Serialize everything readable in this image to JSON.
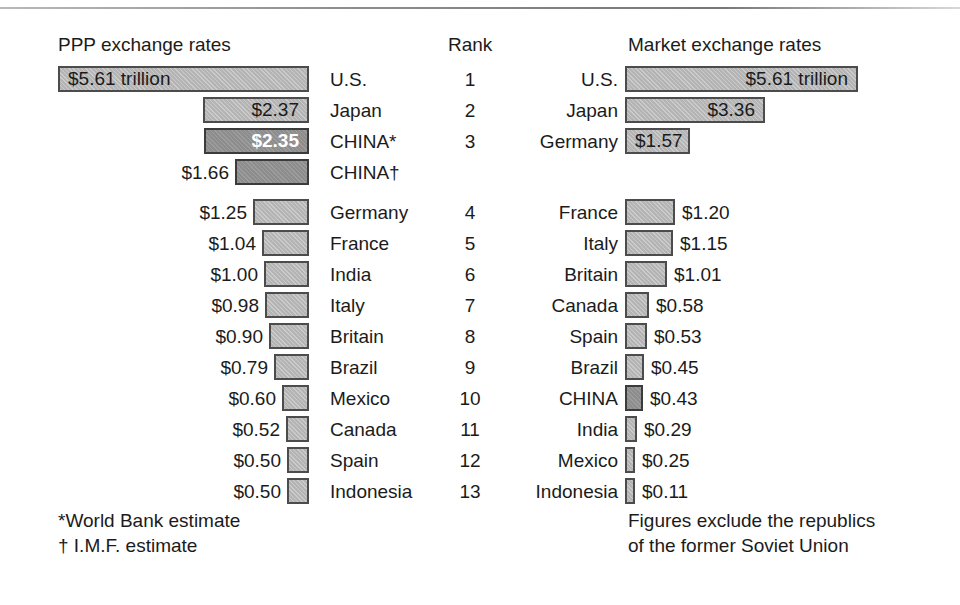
{
  "headers": {
    "ppp": "PPP exchange rates",
    "rank": "Rank",
    "market": "Market exchange rates"
  },
  "footnotes": {
    "left_line1": "*World Bank estimate",
    "left_line2": "† I.M.F. estimate",
    "right_line1": "Figures exclude the republics",
    "right_line2": "of the former Soviet Union"
  },
  "colors": {
    "bar_light": "#b4b4b4",
    "bar_dark": "#8d8d8d",
    "bar_border": "#4c4c4c",
    "text": "#1b1b1b",
    "label_on_dark": "#ffffff",
    "background": "#ffffff",
    "rule": "#8e8e8e"
  },
  "chart_data": {
    "type": "bar",
    "unit": "trillions of U.S. dollars",
    "xlabel": "",
    "ylabel": "",
    "grid": false,
    "legend": "none",
    "orientation": "horizontal",
    "panels": [
      {
        "name": "ppp",
        "title": "PPP exchange rates",
        "direction": "right-to-left",
        "max_value": 5.61,
        "categories": [
          "U.S.",
          "Japan",
          "CHINA*",
          "CHINA†",
          "Germany",
          "France",
          "India",
          "Italy",
          "Britain",
          "Brazil",
          "Mexico",
          "Canada",
          "Spain",
          "Indonesia"
        ],
        "values": [
          5.61,
          2.37,
          2.35,
          1.66,
          1.25,
          1.04,
          1.0,
          0.98,
          0.9,
          0.79,
          0.6,
          0.52,
          0.5,
          0.5
        ],
        "labels": [
          "$5.61 trillion",
          "$2.37",
          "$2.35",
          "$1.66",
          "$1.25",
          "$1.04",
          "$1.00",
          "$0.98",
          "$0.90",
          "$0.79",
          "$0.60",
          "$0.52",
          "$0.50",
          "$0.50"
        ]
      },
      {
        "name": "market",
        "title": "Market exchange rates",
        "direction": "left-to-right",
        "max_value": 5.61,
        "categories": [
          "U.S.",
          "Japan",
          "Germany",
          "France",
          "Italy",
          "Britain",
          "Canada",
          "Spain",
          "Brazil",
          "CHINA",
          "India",
          "Mexico",
          "Indonesia"
        ],
        "values": [
          5.61,
          3.36,
          1.57,
          1.2,
          1.15,
          1.01,
          0.58,
          0.53,
          0.45,
          0.43,
          0.29,
          0.25,
          0.11
        ],
        "labels": [
          "$5.61 trillion",
          "$3.36",
          "$1.57",
          "$1.20",
          "$1.15",
          "$1.01",
          "$0.58",
          "$0.53",
          "$0.45",
          "$0.43",
          "$0.29",
          "$0.25",
          "$0.11"
        ]
      }
    ]
  },
  "rows": [
    {
      "left": {
        "name": "U.S.",
        "value": 5.61,
        "label": "$5.61 trillion",
        "label_inside": true,
        "highlight": false
      },
      "rank": "1",
      "right": {
        "name": "U.S.",
        "value": 5.61,
        "label": "$5.61 trillion",
        "label_inside": true,
        "highlight": false
      }
    },
    {
      "left": {
        "name": "Japan",
        "value": 2.37,
        "label": "$2.37",
        "label_inside": true,
        "highlight": false
      },
      "rank": "2",
      "right": {
        "name": "Japan",
        "value": 3.36,
        "label": "$3.36",
        "label_inside": true,
        "highlight": false
      }
    },
    {
      "left": {
        "name": "CHINA*",
        "value": 2.35,
        "label": "$2.35",
        "label_inside": true,
        "highlight": true
      },
      "rank": "3",
      "right": {
        "name": "Germany",
        "value": 1.57,
        "label": "$1.57",
        "label_inside": true,
        "highlight": false
      }
    },
    {
      "left": {
        "name": "CHINA†",
        "value": 1.66,
        "label": "$1.66",
        "label_inside": false,
        "highlight": true
      },
      "rank": "",
      "right": null
    },
    {
      "left": {
        "name": "Germany",
        "value": 1.25,
        "label": "$1.25",
        "label_inside": false,
        "highlight": false
      },
      "rank": "4",
      "right": {
        "name": "France",
        "value": 1.2,
        "label": "$1.20",
        "label_inside": false,
        "highlight": false
      }
    },
    {
      "left": {
        "name": "France",
        "value": 1.04,
        "label": "$1.04",
        "label_inside": false,
        "highlight": false
      },
      "rank": "5",
      "right": {
        "name": "Italy",
        "value": 1.15,
        "label": "$1.15",
        "label_inside": false,
        "highlight": false
      }
    },
    {
      "left": {
        "name": "India",
        "value": 1.0,
        "label": "$1.00",
        "label_inside": false,
        "highlight": false
      },
      "rank": "6",
      "right": {
        "name": "Britain",
        "value": 1.01,
        "label": "$1.01",
        "label_inside": false,
        "highlight": false
      }
    },
    {
      "left": {
        "name": "Italy",
        "value": 0.98,
        "label": "$0.98",
        "label_inside": false,
        "highlight": false
      },
      "rank": "7",
      "right": {
        "name": "Canada",
        "value": 0.58,
        "label": "$0.58",
        "label_inside": false,
        "highlight": false
      }
    },
    {
      "left": {
        "name": "Britain",
        "value": 0.9,
        "label": "$0.90",
        "label_inside": false,
        "highlight": false
      },
      "rank": "8",
      "right": {
        "name": "Spain",
        "value": 0.53,
        "label": "$0.53",
        "label_inside": false,
        "highlight": false
      }
    },
    {
      "left": {
        "name": "Brazil",
        "value": 0.79,
        "label": "$0.79",
        "label_inside": false,
        "highlight": false
      },
      "rank": "9",
      "right": {
        "name": "Brazil",
        "value": 0.45,
        "label": "$0.45",
        "label_inside": false,
        "highlight": false
      }
    },
    {
      "left": {
        "name": "Mexico",
        "value": 0.6,
        "label": "$0.60",
        "label_inside": false,
        "highlight": false
      },
      "rank": "10",
      "right": {
        "name": "CHINA",
        "value": 0.43,
        "label": "$0.43",
        "label_inside": false,
        "highlight": true
      }
    },
    {
      "left": {
        "name": "Canada",
        "value": 0.52,
        "label": "$0.52",
        "label_inside": false,
        "highlight": false
      },
      "rank": "11",
      "right": {
        "name": "India",
        "value": 0.29,
        "label": "$0.29",
        "label_inside": false,
        "highlight": false
      }
    },
    {
      "left": {
        "name": "Spain",
        "value": 0.5,
        "label": "$0.50",
        "label_inside": false,
        "highlight": false
      },
      "rank": "12",
      "right": {
        "name": "Mexico",
        "value": 0.25,
        "label": "$0.25",
        "label_inside": false,
        "highlight": false
      }
    },
    {
      "left": {
        "name": "Indonesia",
        "value": 0.5,
        "label": "$0.50",
        "label_inside": false,
        "highlight": false
      },
      "rank": "13",
      "right": {
        "name": "Indonesia",
        "value": 0.11,
        "label": "$0.11",
        "label_inside": false,
        "highlight": false
      }
    }
  ]
}
